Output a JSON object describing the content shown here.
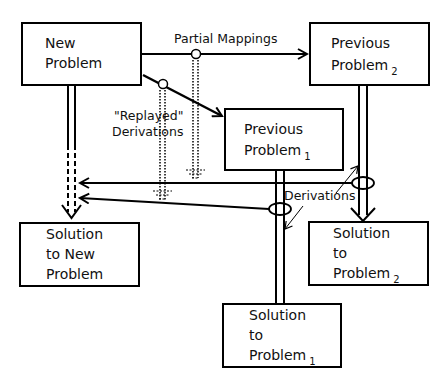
{
  "diagram": {
    "type": "derivational-analogy",
    "nodes": [
      {
        "id": "new_problem",
        "line1": "New",
        "line2": "Problem",
        "subscript": ""
      },
      {
        "id": "previous_problem_2",
        "line1": "Previous",
        "line2": "Problem",
        "subscript": "2"
      },
      {
        "id": "previous_problem_1",
        "line1": "Previous",
        "line2": "Problem",
        "subscript": "1"
      },
      {
        "id": "solution_new",
        "line1": "Solution",
        "line2": "to New",
        "line3": "Problem",
        "subscript": ""
      },
      {
        "id": "solution_2",
        "line1": "Solution",
        "line2": "to",
        "line3": "Problem",
        "subscript": "2"
      },
      {
        "id": "solution_1",
        "line1": "Solution",
        "line2": "to",
        "line3": "Problem",
        "subscript": "1"
      }
    ],
    "labels": {
      "partial_mappings": "Partial Mappings",
      "replayed_line1": "\"Replayed\"",
      "replayed_line2": "Derivations",
      "derivations": "Derivations"
    },
    "edges": [
      {
        "from": "new_problem",
        "to": "previous_problem_2",
        "style": "single-arrow",
        "label": "Partial Mappings"
      },
      {
        "from": "new_problem",
        "to": "previous_problem_1",
        "style": "single-arrow"
      },
      {
        "from": "new_problem",
        "to": "solution_new",
        "style": "dashed-double-arrow"
      },
      {
        "from": "previous_problem_2",
        "to": "solution_2",
        "style": "double-arrow"
      },
      {
        "from": "previous_problem_1",
        "to": "solution_1",
        "style": "double-arrow"
      },
      {
        "from": "previous_problem_2_derivation",
        "to": "solution_new",
        "style": "single-arrow",
        "label": "Derivations"
      },
      {
        "from": "previous_problem_1_derivation",
        "to": "solution_new",
        "style": "single-arrow",
        "label": "Derivations"
      }
    ]
  }
}
